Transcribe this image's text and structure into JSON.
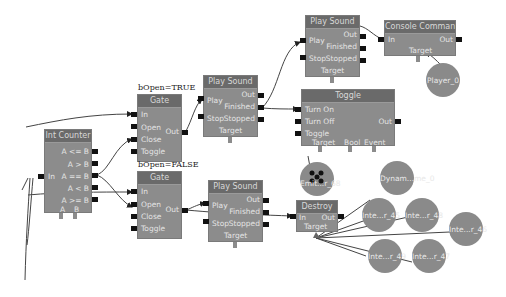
{
  "canvas": {
    "background": "#ffffff",
    "node_color": "#8c8c8c",
    "title_color": "#6a6a6a",
    "pin_color": "#111111"
  },
  "nodes": {
    "int_counter": {
      "title": "Int Counter",
      "inputs": [
        "In"
      ],
      "outputs": [
        "A <= B",
        "A > B",
        "A == B",
        "A < B",
        "A >= B"
      ],
      "vars": [
        "A",
        "B"
      ]
    },
    "gate_true": {
      "caption": "bOpen=TRUE",
      "title": "Gate",
      "inputs": [
        "In",
        "Open",
        "Close",
        "Toggle"
      ],
      "outputs": [
        "Out"
      ]
    },
    "gate_false": {
      "caption": "bOpen=FALSE",
      "title": "Gate",
      "inputs": [
        "In",
        "Open",
        "Close",
        "Toggle"
      ],
      "outputs": [
        "Out"
      ]
    },
    "play_sound_1": {
      "title": "Play Sound",
      "inputs": [
        "Play",
        "Stop"
      ],
      "outputs": [
        "Out",
        "Finished",
        "Stopped"
      ],
      "vars": [
        "Target"
      ]
    },
    "play_sound_2": {
      "title": "Play Sound",
      "inputs": [
        "Play",
        "Stop"
      ],
      "outputs": [
        "Out",
        "Finished",
        "Stopped"
      ],
      "vars": [
        "Target"
      ]
    },
    "play_sound_3": {
      "title": "Play Sound",
      "inputs": [
        "Play",
        "Stop"
      ],
      "outputs": [
        "Out",
        "Finished",
        "Stopped"
      ],
      "vars": [
        "Target"
      ]
    },
    "console_command": {
      "title": "Console Command",
      "inputs": [
        "In"
      ],
      "outputs": [
        "Out"
      ],
      "vars": [
        "Target"
      ]
    },
    "toggle": {
      "title": "Toggle",
      "inputs": [
        "Turn On",
        "Turn Off",
        "Toggle"
      ],
      "outputs": [
        "Out"
      ],
      "vars": [
        "Target",
        "Bool",
        "Event"
      ]
    },
    "destroy": {
      "title": "Destroy",
      "inputs": [
        "In"
      ],
      "outputs": [
        "Out"
      ],
      "vars": [
        "Target"
      ]
    }
  },
  "variables": {
    "player": "Player_0",
    "emitter": "Emit...r_68",
    "dynamic": "Dynam...me_0",
    "inter45": "Inte...r_45",
    "inter48": "Inte...r_48",
    "inter46": "Inte...r_46",
    "inter49": "Inte...r_49",
    "inter47": "Inte...r_47"
  }
}
